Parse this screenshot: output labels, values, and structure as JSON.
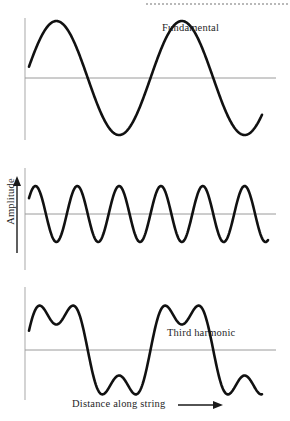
{
  "figure": {
    "title_present": false,
    "background_color": "#ffffff",
    "curve_color": "#111111",
    "axis_color": "#9a9a9a",
    "text_color": "#1f1f1f"
  },
  "labels": {
    "fundamental": "Fundamental",
    "third_harmonic": "Third harmonic",
    "composite": "Composite",
    "y_axis": "Amplitude",
    "x_axis": "Distance along string"
  },
  "icons": {
    "y_axis_arrow": "arrow-up-icon",
    "x_axis_arrow": "arrow-right-icon",
    "dotted_rule": "dotted-rule-icon"
  },
  "chart_data": [
    {
      "type": "line",
      "title": "Fundamental",
      "xlabel": "",
      "ylabel": "Amplitude",
      "grid": false,
      "legend": "none",
      "x_start": 0,
      "x_end": 2,
      "cycles": 2,
      "amplitude": 1,
      "harmonic": 1,
      "axis_y_zero": 78,
      "x_axis_pixel_start": 25,
      "x_axis_pixel_end": 276,
      "curve_pixel_start": 29,
      "curve_pixel_end": 262,
      "xlim": [
        0,
        2
      ],
      "ylim": [
        -1.15,
        1.15
      ],
      "description": "Two full cycles of a sine wave, amplitude 1"
    },
    {
      "type": "line",
      "title": "Third harmonic",
      "xlabel": "",
      "ylabel": "Amplitude",
      "grid": false,
      "legend": "none",
      "x_start": 0,
      "x_end": 2,
      "cycles": 6,
      "amplitude": 0.34,
      "harmonic": 3,
      "axis_y_zero": 64,
      "x_axis_pixel_start": 25,
      "x_axis_pixel_end": 276,
      "curve_pixel_start": 29,
      "curve_pixel_end": 268,
      "xlim": [
        0,
        2
      ],
      "ylim": [
        -1.15,
        1.15
      ],
      "description": "Six full cycles of a sine wave, one third the wavelength and about one third the amplitude of the fundamental"
    },
    {
      "type": "line",
      "title": "Composite",
      "xlabel": "Distance along string",
      "ylabel": "Amplitude",
      "grid": false,
      "legend": "none",
      "x_start": 0,
      "x_end": 2,
      "cycles": 2,
      "amplitude": 1,
      "harmonic": "1+3",
      "axis_y_zero": 70,
      "x_axis_pixel_start": 25,
      "x_axis_pixel_end": 276,
      "curve_pixel_start": 29,
      "curve_pixel_end": 262,
      "xlim": [
        0,
        2
      ],
      "ylim": [
        -1.4,
        1.4
      ],
      "description": "Point-by-point sum of the fundamental and the third harmonic, giving a flat-topped double-humped waveform"
    }
  ]
}
